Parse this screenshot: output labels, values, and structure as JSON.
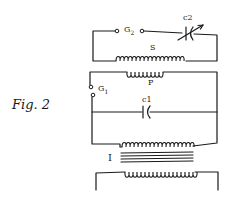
{
  "figure": {
    "caption": "Fig. 2"
  },
  "labels": {
    "g2": "G",
    "g2_sub": "2",
    "c2": "c2",
    "s": "S",
    "p": "P",
    "g1": "G",
    "g1_sub": "1",
    "c1": "c1",
    "t": "I"
  },
  "components": [
    {
      "id": "G2",
      "type": "spark-gap",
      "circuit": "secondary"
    },
    {
      "id": "C2",
      "type": "variable-condenser",
      "circuit": "secondary"
    },
    {
      "id": "S",
      "type": "secondary-coil",
      "circuit": "secondary"
    },
    {
      "id": "P",
      "type": "primary-coil",
      "circuit": "primary"
    },
    {
      "id": "G1",
      "type": "spark-gap",
      "circuit": "primary"
    },
    {
      "id": "C1",
      "type": "condenser",
      "circuit": "primary"
    },
    {
      "id": "T",
      "type": "transformer",
      "circuit": "supply"
    }
  ],
  "colors": {
    "ink": "#1a1a1a",
    "paper": "#ffffff"
  }
}
